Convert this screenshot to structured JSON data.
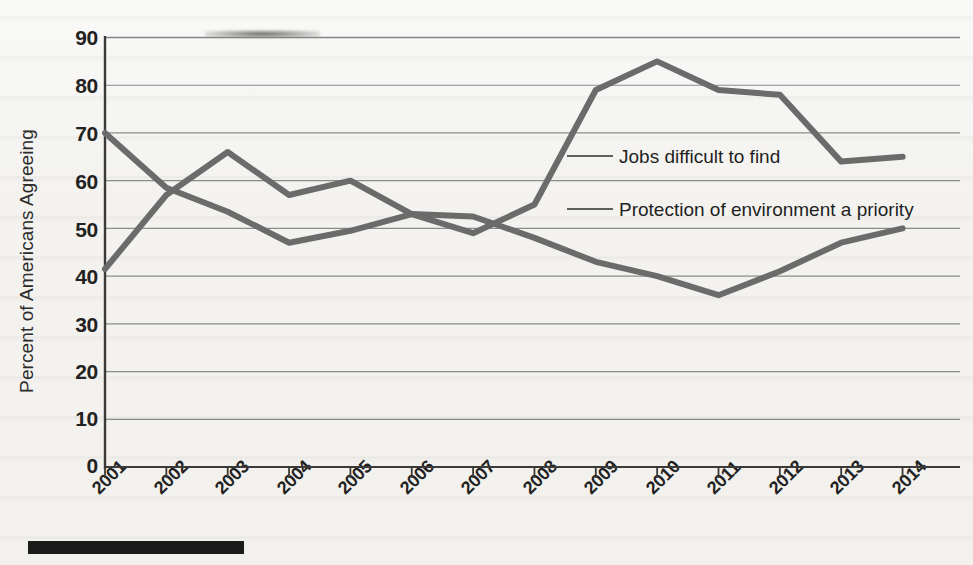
{
  "chart_data": {
    "type": "line",
    "title": "",
    "xlabel": "",
    "ylabel": "Percent of Americans Agreeing",
    "ylim": [
      0,
      90
    ],
    "yticks": [
      0,
      10,
      20,
      30,
      40,
      50,
      60,
      70,
      80,
      90
    ],
    "grid": true,
    "legend_position": "inline-annotation",
    "categories": [
      "2001",
      "2002",
      "2003",
      "2004",
      "2005",
      "2006",
      "2007",
      "2008",
      "2009",
      "2010",
      "2011",
      "2012",
      "2013",
      "2014"
    ],
    "series": [
      {
        "name": "Jobs difficult to find",
        "color": "#6b6b6b",
        "values": [
          41.5,
          57,
          66,
          57,
          60,
          53,
          49,
          55,
          79,
          85,
          79,
          78,
          64,
          65
        ]
      },
      {
        "name": "Protection of environment a priority",
        "color": "#6b6b6b",
        "values": [
          70,
          58.5,
          53.5,
          47,
          49.5,
          53,
          52.5,
          48,
          43,
          40,
          36,
          41,
          47,
          50
        ]
      }
    ],
    "annotations": [
      {
        "text": "Jobs difficult to find",
        "series": "Jobs difficult to find"
      },
      {
        "text": "Protection of environment a priority",
        "series": "Protection of environment a priority"
      }
    ]
  },
  "axes": {
    "y_axis_title": "Percent of Americans Agreeing",
    "y_tick_labels": [
      "90",
      "80",
      "70",
      "60",
      "50",
      "40",
      "30",
      "20",
      "10",
      "0"
    ],
    "x_tick_labels": [
      "2001",
      "2002",
      "2003",
      "2004",
      "2005",
      "2006",
      "2007",
      "2008",
      "2009",
      "2010",
      "2011",
      "2012",
      "2013",
      "2014"
    ]
  },
  "legend": {
    "jobs_label": "Jobs difficult to find",
    "environment_label": "Protection of environment a priority"
  },
  "colors": {
    "line": "#6b6b6b",
    "grid": "#7a7a7a",
    "axis": "#3b3a38",
    "text": "#222222",
    "page_background": "#f3f2ef",
    "bottom_bar": "#1b1b1b"
  }
}
